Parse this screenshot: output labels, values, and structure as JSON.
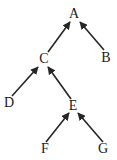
{
  "diagram": {
    "type": "directed-graph",
    "title": "",
    "background_color": "#ffffff",
    "stroke_color": "#262626",
    "text_color": "#1a1a1a",
    "nodes": [
      {
        "id": "A",
        "label": "A",
        "x": 74,
        "y": 14
      },
      {
        "id": "B",
        "label": "B",
        "x": 106,
        "y": 58
      },
      {
        "id": "C",
        "label": "C",
        "x": 44,
        "y": 59
      },
      {
        "id": "D",
        "label": "D",
        "x": 9,
        "y": 103
      },
      {
        "id": "E",
        "label": "E",
        "x": 73,
        "y": 106
      },
      {
        "id": "F",
        "label": "F",
        "x": 45,
        "y": 149
      },
      {
        "id": "G",
        "label": "G",
        "x": 103,
        "y": 149
      }
    ],
    "edges": [
      {
        "id": "C-A",
        "from": "C",
        "to": "A",
        "x1": 48,
        "y1": 52,
        "x2": 70,
        "y2": 22,
        "arrow": "end"
      },
      {
        "id": "B-A",
        "from": "B",
        "to": "A",
        "x1": 104,
        "y1": 50,
        "x2": 80,
        "y2": 22,
        "arrow": "end"
      },
      {
        "id": "D-C",
        "from": "D",
        "to": "C",
        "x1": 12,
        "y1": 96,
        "x2": 38,
        "y2": 67,
        "arrow": "end"
      },
      {
        "id": "E-C",
        "from": "E",
        "to": "C",
        "x1": 71,
        "y1": 99,
        "x2": 48,
        "y2": 67,
        "arrow": "end"
      },
      {
        "id": "F-E",
        "from": "F",
        "to": "E",
        "x1": 46,
        "y1": 142,
        "x2": 69,
        "y2": 113,
        "arrow": "end"
      },
      {
        "id": "G-E",
        "from": "G",
        "to": "E",
        "x1": 103,
        "y1": 142,
        "x2": 78,
        "y2": 113,
        "arrow": "end"
      }
    ]
  }
}
